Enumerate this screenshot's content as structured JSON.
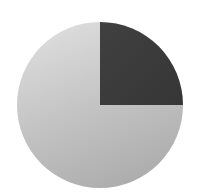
{
  "chart_data": {
    "type": "pie",
    "title": "",
    "legend": [],
    "categories": [
      "Slice A",
      "Slice B"
    ],
    "values": [
      25,
      75
    ],
    "colors": [
      "#3b3b3b",
      "#c4c4c4"
    ],
    "start_angle_deg": 0,
    "direction": "clockwise-from-top",
    "labels_shown": false
  },
  "geometry": {
    "cx": 100,
    "cy": 105,
    "r": 83
  }
}
